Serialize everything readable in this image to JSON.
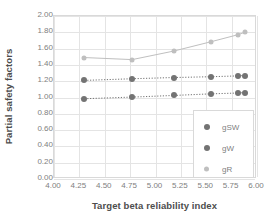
{
  "chart_data": {
    "type": "scatter",
    "title": "",
    "xlabel": "Target beta reliability index",
    "ylabel": "Partial safety factors",
    "xlim": [
      4.0,
      6.0
    ],
    "ylim": [
      0.0,
      2.0
    ],
    "grid": true,
    "legend_position": "inside-bottom-right",
    "xticks": [
      "4.00",
      "4.25",
      "4.50",
      "4.75",
      "5.00",
      "5.25",
      "5.50",
      "5.75",
      "6.00"
    ],
    "yticks": [
      "0.00",
      "0.20",
      "0.40",
      "0.60",
      "0.80",
      "1.00",
      "1.20",
      "1.40",
      "1.60",
      "1.80",
      "2.00"
    ],
    "series": [
      {
        "name": "gSW",
        "color": "#737373",
        "marker_size": 6,
        "line_style": "dotted",
        "x": [
          4.3,
          4.77,
          5.18,
          5.55,
          5.81,
          5.88
        ],
        "y": [
          1.21,
          1.23,
          1.245,
          1.255,
          1.265,
          1.27
        ]
      },
      {
        "name": "gW",
        "color": "#737373",
        "marker_size": 6,
        "line_style": "dotted",
        "x": [
          4.3,
          4.77,
          5.18,
          5.55,
          5.81,
          5.88
        ],
        "y": [
          0.985,
          1.005,
          1.025,
          1.045,
          1.055,
          1.06
        ]
      },
      {
        "name": "gR",
        "color": "#bfbfbf",
        "marker_size": 5,
        "line_style": "solid",
        "x": [
          4.3,
          4.77,
          5.18,
          5.55,
          5.81,
          5.88
        ],
        "y": [
          1.49,
          1.465,
          1.57,
          1.685,
          1.77,
          1.8
        ]
      }
    ]
  },
  "legend": {
    "entries": [
      {
        "label": "gSW"
      },
      {
        "label": "gW"
      },
      {
        "label": "gR"
      }
    ]
  },
  "colors": {
    "dark_marker": "#737373",
    "light_marker": "#bfbfbf",
    "grid": "#e4e4e4",
    "axis_text": "#808080",
    "title_text": "#4d4d4d"
  }
}
